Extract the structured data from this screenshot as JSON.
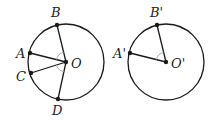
{
  "diagram": {
    "stroke_color": "#1a1a1a",
    "angle_mark_color": "#aaaaaa",
    "left_circle": {
      "center_label": "O",
      "points": [
        {
          "label": "B",
          "x": 57,
          "y": 25,
          "lx": 50,
          "ly": 16
        },
        {
          "label": "A",
          "x": 30,
          "y": 53,
          "lx": 15,
          "ly": 58
        },
        {
          "label": "C",
          "x": 31,
          "y": 73,
          "lx": 15,
          "ly": 82
        },
        {
          "label": "D",
          "x": 58,
          "y": 99,
          "lx": 51,
          "ly": 116
        }
      ]
    },
    "right_circle": {
      "center_label": "O'",
      "points": [
        {
          "label": "B'",
          "x": 157,
          "y": 25,
          "lx": 150,
          "ly": 16
        },
        {
          "label": "A'",
          "x": 130,
          "y": 53,
          "lx": 113,
          "ly": 58
        }
      ]
    }
  }
}
